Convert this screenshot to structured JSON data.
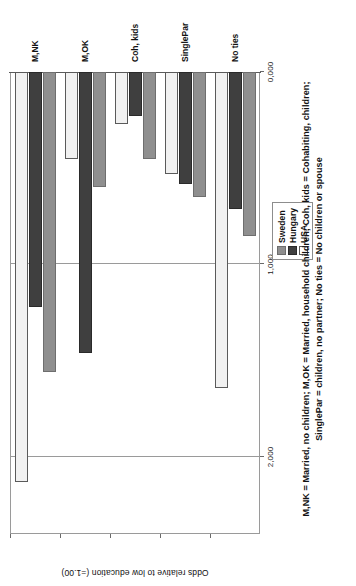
{
  "chart_data": {
    "type": "bar",
    "orientation": "horizontal",
    "title": "",
    "xlabel": "",
    "ylabel": "Odds relative to low education (=1.00)",
    "categories": [
      "M,NK",
      "M,OK",
      "Coh, kids",
      "SinglePar",
      "No ties"
    ],
    "series": [
      {
        "name": "Sweden",
        "color": "#8f8f8f",
        "values": [
          1.56,
          0.6,
          0.45,
          0.65,
          0.85
        ]
      },
      {
        "name": "Hungary",
        "color": "#3f3f3f",
        "values": [
          1.22,
          1.46,
          0.23,
          0.58,
          0.71
        ]
      },
      {
        "name": "USA",
        "color": "#ffffff",
        "values": [
          2.13,
          0.45,
          0.27,
          0.53,
          1.64
        ]
      }
    ],
    "value_axis": {
      "min": 0,
      "max": 2.4,
      "ticks": [
        0,
        1,
        2
      ],
      "tick_labels": [
        "0,000",
        "1,000",
        "2,000"
      ],
      "gridlines": [
        1,
        2
      ]
    },
    "grid": true,
    "legend_position": "right-outside",
    "legend_entries": [
      "Sweden",
      "Hungary",
      "USA"
    ],
    "annotations": [
      "M,NK = Married, no children; M,OK = Married, household children; Coh, kids = Cohabiting, children;",
      "SinglePar = children, no partner; No ties = No children or spouse"
    ]
  },
  "legend": {
    "items": [
      {
        "label": "Sweden"
      },
      {
        "label": "Hungary"
      },
      {
        "label": "USA"
      }
    ]
  },
  "axis": {
    "value_title": "Odds relative to low education (=1.00)",
    "tick_labels": [
      "0,000",
      "1,000",
      "2,000"
    ],
    "category_labels": [
      "M,NK",
      "M,OK",
      "Coh, kids",
      "SinglePar",
      "No ties"
    ]
  },
  "footnote": {
    "line1": "M,NK = Married, no children; M,OK = Married, household children; Coh, kids = Cohabiting, children;",
    "line2": "SinglePar = children, no partner; No ties = No children or spouse"
  }
}
